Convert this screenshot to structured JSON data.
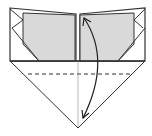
{
  "diagram": {
    "colors": {
      "background": "#ffffff",
      "line": "#333333",
      "paper_colored": "#d9d9d9",
      "paper_white": "#ffffff",
      "thin_line": "#666666"
    },
    "elements": [
      {
        "name": "left-flap",
        "kind": "colored-panel"
      },
      {
        "name": "right-flap",
        "kind": "colored-panel"
      },
      {
        "name": "bottom-triangle",
        "kind": "white-paper"
      },
      {
        "name": "valley-fold-line",
        "kind": "dashed-line"
      },
      {
        "name": "center-crease",
        "kind": "thin-line"
      },
      {
        "name": "fold-and-unfold-arrow",
        "kind": "double-headed-curved-arrow"
      }
    ]
  }
}
